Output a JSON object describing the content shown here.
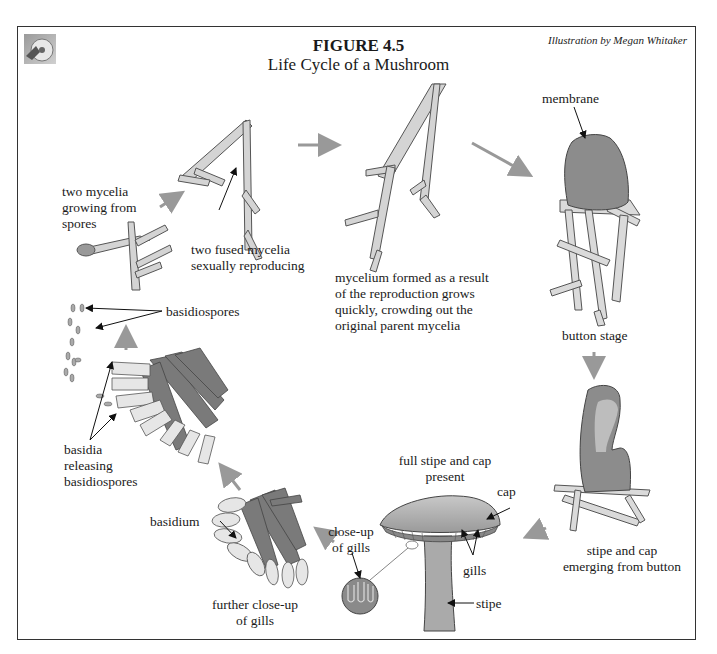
{
  "figure": {
    "number": "FIGURE 4.5",
    "title": "Life Cycle of a Mushroom",
    "credit": "Illustration by Megan Whitaker"
  },
  "colors": {
    "hypha_fill": "#d4d4d4",
    "hypha_stroke": "#555555",
    "button_fill": "#8c8c8c",
    "arrow_gray": "#999999",
    "basidium_fill": "#e6e6e6",
    "gill_tissue": "#7a7a7a",
    "mushroom_fill": "#b5b5b5"
  },
  "stages": [
    {
      "id": "spores-germinating",
      "label": "two mycelia\ngrowing from\nspores"
    },
    {
      "id": "fused-mycelia",
      "label": "two fused mycelia\nsexually reproducing"
    },
    {
      "id": "mycelium-formed",
      "label": "mycelium formed as a result\nof the reproduction grows\nquickly, crowding out the\noriginal parent mycelia"
    },
    {
      "id": "button-stage",
      "label": "button stage",
      "callout": "membrane"
    },
    {
      "id": "stipe-cap-emerging",
      "label": "stipe and cap\nemerging from button"
    },
    {
      "id": "full-mushroom",
      "label": "full stipe and cap\npresent",
      "callouts": [
        "cap",
        "gills",
        "stipe"
      ],
      "inset_label": "close-up\nof gills"
    },
    {
      "id": "further-closeup",
      "label": "further close-up\nof gills",
      "callout": "basidium"
    },
    {
      "id": "basidia-releasing",
      "label": "basidia\nreleasing\nbasidiospores",
      "callout": "basidiospores"
    }
  ],
  "labels": {
    "two_mycelia": [
      "two mycelia",
      "growing from",
      "spores"
    ],
    "fused": [
      "two fused mycelia",
      "sexually reproducing"
    ],
    "mycelium_formed": [
      "mycelium formed as a result",
      "of the reproduction grows",
      "quickly, crowding out the",
      "original parent mycelia"
    ],
    "membrane": "membrane",
    "button_stage": "button stage",
    "stipe_cap_emerging": [
      "stipe and cap",
      "emerging from button"
    ],
    "full_mushroom": [
      "full stipe and cap",
      "present"
    ],
    "cap": "cap",
    "gills": "gills",
    "stipe": "stipe",
    "closeup_gills": [
      "close-up",
      "of gills"
    ],
    "further_closeup": [
      "further close-up",
      "of gills"
    ],
    "basidium": "basidium",
    "basidiospores": "basidiospores",
    "basidia_releasing": [
      "basidia",
      "releasing",
      "basidiospores"
    ]
  }
}
